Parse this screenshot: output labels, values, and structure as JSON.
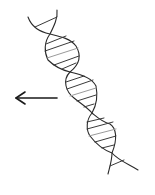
{
  "illustration": {
    "subject": "DNA double helix sketch",
    "style": "hand-drawn pencil line art",
    "background": "#ffffff",
    "stroke_color": "#2a2a2a",
    "rung_color": "#3a3a3a",
    "light_rung_color": "#9a9a9a",
    "helix_turns": 3,
    "arrow": {
      "direction": "left",
      "color": "#1a1a1a"
    }
  }
}
